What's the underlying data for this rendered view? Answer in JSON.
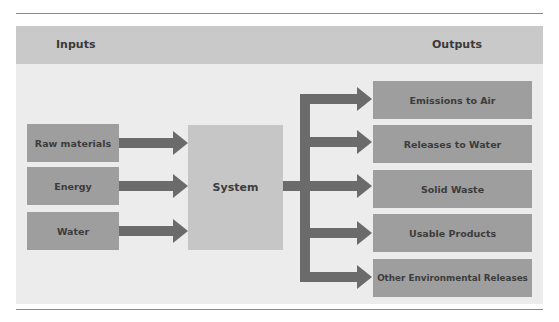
{
  "diagram": {
    "headers": {
      "inputs": "Inputs",
      "outputs": "Outputs"
    },
    "inputs": [
      {
        "label": "Raw materials"
      },
      {
        "label": "Energy"
      },
      {
        "label": "Water"
      }
    ],
    "system": {
      "label": "System"
    },
    "outputs": [
      {
        "label": "Emissions to Air"
      },
      {
        "label": "Releases to Water"
      },
      {
        "label": "Solid Waste"
      },
      {
        "label": "Usable Products"
      },
      {
        "label": "Other Environmental Releases"
      }
    ],
    "colors": {
      "panel": "#ececec",
      "header_band": "#c9c9c9",
      "box": "#9e9e9e",
      "system_box": "#c6c6c6",
      "arrow": "#6b6b6b",
      "text": "#3a3a3a"
    }
  }
}
